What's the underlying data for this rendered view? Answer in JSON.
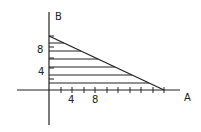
{
  "diagram": {
    "type": "feasible-region-plot",
    "axes": {
      "x_label": "A",
      "y_label": "B",
      "x_tick_labels": [
        {
          "value": 4,
          "label": "4"
        },
        {
          "value": 8,
          "label": "8"
        }
      ],
      "y_tick_labels": [
        {
          "value": 4,
          "label": "4"
        },
        {
          "value": 8,
          "label": "8"
        }
      ],
      "x_ticks": [
        2,
        4,
        6,
        8,
        10,
        12,
        14,
        16,
        18,
        20
      ],
      "y_ticks": [
        2,
        4,
        6,
        8,
        10
      ]
    },
    "region": {
      "shape": "triangle",
      "vertices": [
        [
          0,
          0
        ],
        [
          0,
          10
        ],
        [
          20,
          0
        ]
      ],
      "boundary_line": {
        "a_intercept": 20,
        "b_intercept": 10
      },
      "fill": "horizontal-hatching",
      "hatch_count": 7
    },
    "colors": {
      "line": "#222222",
      "background": "#ffffff"
    }
  }
}
